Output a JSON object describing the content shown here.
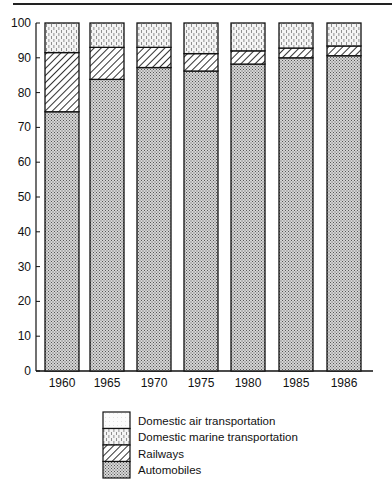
{
  "chart_data": {
    "type": "bar",
    "stacked": true,
    "title": "",
    "xlabel": "",
    "ylabel": "",
    "ylim": [
      0,
      100
    ],
    "yticks": [
      0,
      10,
      20,
      30,
      40,
      50,
      60,
      70,
      80,
      90,
      100
    ],
    "grid": false,
    "legend_position": "bottom",
    "categories": [
      "1960",
      "1965",
      "1970",
      "1975",
      "1980",
      "1985",
      "1986"
    ],
    "series": [
      {
        "name": "Automobiles",
        "pattern": "fine-dots",
        "values": [
          74.5,
          83.8,
          87.2,
          86.2,
          88.2,
          90.0,
          90.6
        ]
      },
      {
        "name": "Railways",
        "pattern": "diagonal-hatch",
        "values": [
          17.0,
          9.2,
          5.8,
          5.0,
          3.8,
          2.8,
          2.8
        ]
      },
      {
        "name": "Domestic marine transportation",
        "pattern": "vertical-dashes",
        "values": [
          8.5,
          7.0,
          7.0,
          8.8,
          8.0,
          7.2,
          6.6
        ]
      },
      {
        "name": "Domestic air transportation",
        "pattern": "light-dots",
        "values": [
          0.0,
          0.0,
          0.0,
          0.0,
          0.0,
          0.0,
          0.0
        ]
      }
    ]
  },
  "legend": {
    "items": [
      {
        "label": "Domestic air transportation",
        "pattern": "light-dots"
      },
      {
        "label": "Domestic marine transportation",
        "pattern": "vertical-dashes"
      },
      {
        "label": "Railways",
        "pattern": "diagonal-hatch"
      },
      {
        "label": "Automobiles",
        "pattern": "fine-dots"
      }
    ]
  }
}
